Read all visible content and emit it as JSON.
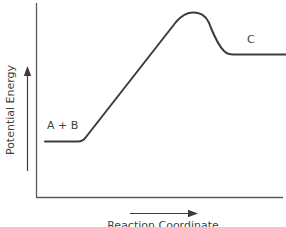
{
  "diagram": {
    "type": "energy-profile",
    "y_axis_label": "Potential Energy",
    "x_axis_label": "Reaction Coordinate",
    "reactant_label": "A + B",
    "product_label": "C",
    "line_color": "#3c3c3c",
    "axis_color": "#5a5a5a",
    "arrow_y_direction": "up",
    "arrow_x_direction": "right"
  },
  "curve": {
    "segments": [
      {
        "name": "reactant-plateau",
        "description": "A + B at low energy"
      },
      {
        "name": "ascent",
        "description": "linear rise toward transition state"
      },
      {
        "name": "transition-state",
        "description": "rounded peak near top"
      },
      {
        "name": "descent",
        "description": "drop to product level"
      },
      {
        "name": "product-plateau",
        "description": "C at intermediate energy"
      }
    ]
  }
}
